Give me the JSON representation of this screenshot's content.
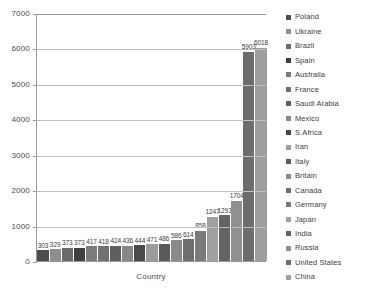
{
  "chart_data": {
    "type": "bar",
    "title": "",
    "xlabel": "Country",
    "ylabel": "",
    "ylim": [
      0,
      7000
    ],
    "grid": true,
    "legend_position": "right",
    "ytick_labels": [
      "0",
      "1000",
      "2000",
      "3000",
      "4000",
      "5000",
      "6000",
      "7000"
    ],
    "yticks": [
      0,
      1000,
      2000,
      3000,
      4000,
      5000,
      6000,
      7000
    ],
    "categories": [
      "Poland",
      "Ukraine",
      "Brazil",
      "Spain",
      "Australia",
      "France",
      "Saudi Arabia",
      "Mexico",
      "S.Africa",
      "Iran",
      "Italy",
      "Britain",
      "Canada",
      "Germany",
      "Japan",
      "India",
      "Russia",
      "United States",
      "China"
    ],
    "values": [
      303,
      329,
      373,
      373,
      417,
      418,
      424,
      436,
      444,
      471,
      486,
      586,
      614,
      858,
      1247,
      1293,
      1704,
      5903,
      6018
    ],
    "data_labels": [
      "303",
      "329",
      "373",
      "373",
      "417",
      "418",
      "424",
      "436",
      "444",
      "471",
      "486",
      "586",
      "614",
      "858",
      "1247",
      "1293",
      "1704",
      "5903",
      "6018"
    ],
    "bar_colors": [
      "#4d4d4d",
      "#8e8e8e",
      "#6a6a6a",
      "#3f3f3f",
      "#7c7c7c",
      "#707070",
      "#5e5e5e",
      "#888888",
      "#4a4a4a",
      "#9b9b9b",
      "#5a5a5a",
      "#8a8a8a",
      "#6e6e6e",
      "#7a7a7a",
      "#a0a0a0",
      "#636363",
      "#909090",
      "#6c6c6c",
      "#9e9e9e"
    ]
  },
  "legend": {
    "items": [
      {
        "label": "Poland",
        "color": "#4d4d4d"
      },
      {
        "label": "Ukraine",
        "color": "#8e8e8e"
      },
      {
        "label": "Brazil",
        "color": "#6a6a6a"
      },
      {
        "label": "Spain",
        "color": "#3f3f3f"
      },
      {
        "label": "Australia",
        "color": "#7c7c7c"
      },
      {
        "label": "France",
        "color": "#707070"
      },
      {
        "label": "Saudi Arabia",
        "color": "#5e5e5e"
      },
      {
        "label": "Mexico",
        "color": "#888888"
      },
      {
        "label": "S.Africa",
        "color": "#4a4a4a"
      },
      {
        "label": "Iran",
        "color": "#9b9b9b"
      },
      {
        "label": "Italy",
        "color": "#5a5a5a"
      },
      {
        "label": "Britain",
        "color": "#8a8a8a"
      },
      {
        "label": "Canada",
        "color": "#6e6e6e"
      },
      {
        "label": "Germany",
        "color": "#7a7a7a"
      },
      {
        "label": "Japan",
        "color": "#a0a0a0"
      },
      {
        "label": "India",
        "color": "#636363"
      },
      {
        "label": "Russia",
        "color": "#909090"
      },
      {
        "label": "United States",
        "color": "#6c6c6c"
      },
      {
        "label": "China",
        "color": "#9e9e9e"
      }
    ]
  }
}
